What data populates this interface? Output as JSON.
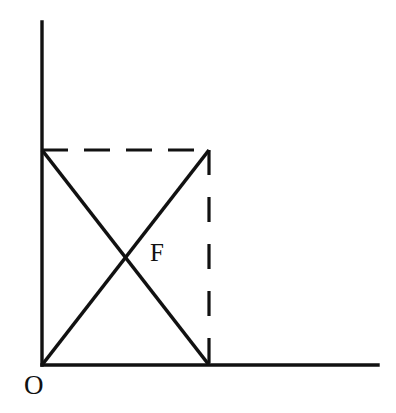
{
  "figure": {
    "background_color": "#ffffff",
    "stroke_color": "#111111",
    "width": 396,
    "height": 413
  },
  "labels": {
    "origin": "O",
    "intersection": "F"
  },
  "chart_data": {
    "type": "line",
    "title": "",
    "xlabel": "",
    "ylabel": "",
    "grid": false,
    "legend": "none",
    "axes": {
      "origin_px": [
        42,
        365
      ],
      "y_axis": {
        "from_px": [
          42,
          365
        ],
        "to_px": [
          42,
          22
        ],
        "style": "solid",
        "arrow": false
      },
      "x_axis": {
        "from_px": [
          42,
          365
        ],
        "to_px": [
          378,
          365
        ],
        "style": "solid",
        "arrow": false
      }
    },
    "points": [
      {
        "name": "O",
        "px": [
          42,
          365
        ],
        "labeled": true,
        "label_text": "O"
      },
      {
        "name": "A",
        "px": [
          42,
          150
        ],
        "labeled": false
      },
      {
        "name": "B",
        "px": [
          209,
          150
        ],
        "labeled": false
      },
      {
        "name": "C",
        "px": [
          209,
          365
        ],
        "labeled": false
      },
      {
        "name": "F",
        "px": [
          125,
          258
        ],
        "labeled": true,
        "label_text": "F"
      }
    ],
    "segments": [
      {
        "name": "rising-diagonal",
        "from": "O",
        "to": "B",
        "from_px": [
          42,
          365
        ],
        "to_px": [
          209,
          150
        ],
        "style": "solid",
        "color": "#111111"
      },
      {
        "name": "falling-diagonal",
        "from": "A",
        "to": "C",
        "from_px": [
          42,
          150
        ],
        "to_px": [
          209,
          365
        ],
        "style": "solid",
        "color": "#111111"
      },
      {
        "name": "top-dashed",
        "from": "A",
        "to": "B",
        "from_px": [
          42,
          150
        ],
        "to_px": [
          209,
          150
        ],
        "style": "dashed",
        "color": "#111111"
      },
      {
        "name": "right-dashed",
        "from": "B",
        "to": "C",
        "from_px": [
          209,
          150
        ],
        "to_px": [
          209,
          365
        ],
        "style": "dashed",
        "color": "#111111"
      }
    ]
  }
}
